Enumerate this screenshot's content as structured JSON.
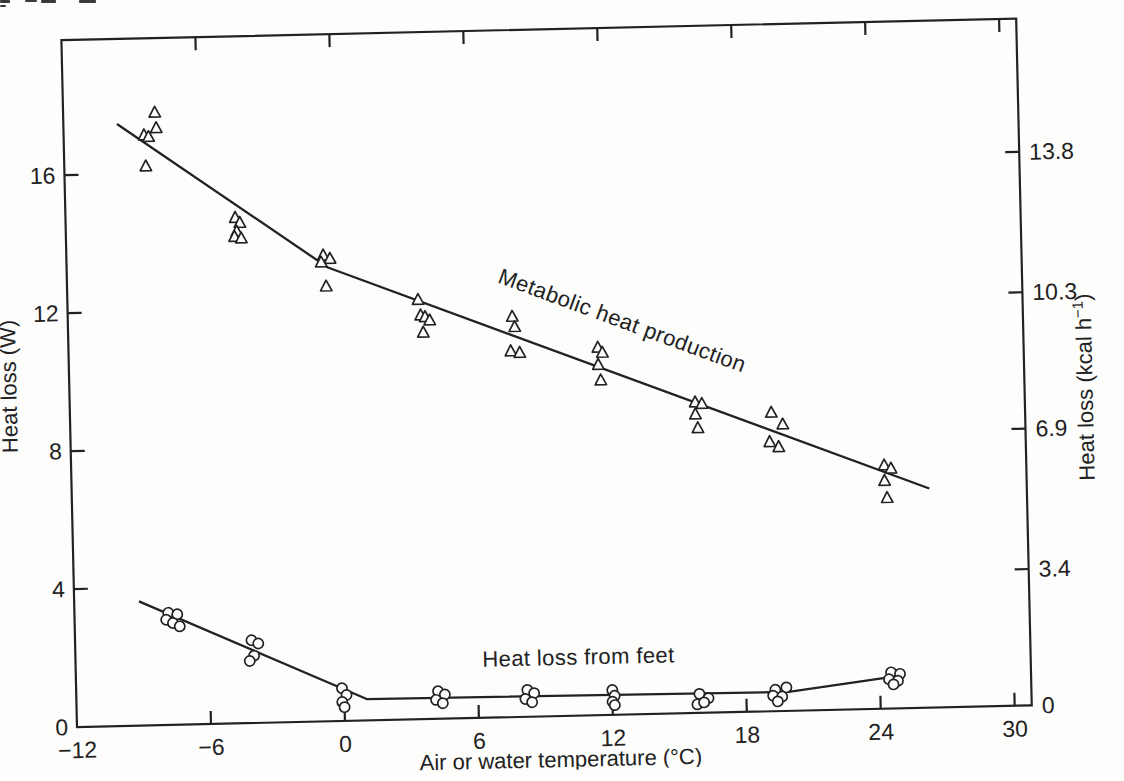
{
  "figure": {
    "paper_color": "#fdfdfc",
    "ink_color": "#222222",
    "scan_tilt_deg": -1.3
  },
  "scan_artifacts": [
    {
      "x": 0,
      "y": 0,
      "w": 10,
      "h": 3
    },
    {
      "x": 0,
      "y": 5,
      "w": 6,
      "h": 2
    },
    {
      "x": 25,
      "y": 0,
      "w": 12,
      "h": 2
    },
    {
      "x": 41,
      "y": 0,
      "w": 15,
      "h": 3
    },
    {
      "x": 79,
      "y": 0,
      "w": 17,
      "h": 3
    }
  ],
  "chart_data": {
    "type": "scatter",
    "title": "",
    "xlabel": "Air or water temperature (°C)",
    "ylabel_left": "Heat loss (W)",
    "ylabel_right": "Heat loss (kcal h⁻¹)",
    "xlim": [
      -12,
      30.7
    ],
    "ylim_watts": [
      0,
      19.9
    ],
    "x_ticks": [
      -12,
      -6,
      0,
      6,
      12,
      18,
      24,
      30
    ],
    "y_ticks_left": [
      0,
      4,
      8,
      12,
      16
    ],
    "y_ticks_right": [
      "0",
      "3.4",
      "6.9",
      "10.3",
      "13.8"
    ],
    "kcal_per_watt": 0.86,
    "grid": false,
    "legend": "inline-annotations",
    "series": [
      {
        "name": "Metabolic heat production",
        "marker": "triangle",
        "points": [
          [
            -7.9,
            17.75
          ],
          [
            -7.85,
            17.3
          ],
          [
            -8.4,
            17.1
          ],
          [
            -8.2,
            17.05
          ],
          [
            -8.35,
            16.2
          ],
          [
            -4.4,
            14.65
          ],
          [
            -4.2,
            14.5
          ],
          [
            -4.35,
            14.25
          ],
          [
            -4.45,
            14.1
          ],
          [
            -4.15,
            14.05
          ],
          [
            -0.5,
            13.5
          ],
          [
            -0.2,
            13.4
          ],
          [
            -0.6,
            13.3
          ],
          [
            -0.4,
            12.6
          ],
          [
            3.7,
            12.15
          ],
          [
            3.8,
            11.7
          ],
          [
            4.0,
            11.65
          ],
          [
            4.2,
            11.55
          ],
          [
            3.9,
            11.2
          ],
          [
            7.9,
            11.6
          ],
          [
            8.0,
            11.3
          ],
          [
            7.8,
            10.6
          ],
          [
            8.2,
            10.55
          ],
          [
            11.7,
            10.65
          ],
          [
            11.9,
            10.5
          ],
          [
            11.7,
            10.15
          ],
          [
            11.8,
            9.7
          ],
          [
            16.0,
            9.0
          ],
          [
            16.3,
            8.95
          ],
          [
            16.0,
            8.65
          ],
          [
            16.1,
            8.25
          ],
          [
            19.4,
            8.65
          ],
          [
            19.9,
            8.3
          ],
          [
            19.3,
            7.8
          ],
          [
            19.7,
            7.65
          ],
          [
            24.4,
            7.05
          ],
          [
            24.7,
            6.95
          ],
          [
            24.4,
            6.6
          ],
          [
            24.5,
            6.1
          ]
        ],
        "fit_line": [
          [
            -9.6,
            17.45
          ],
          [
            -0.3,
            13.15
          ],
          [
            26.4,
            6.35
          ]
        ]
      },
      {
        "name": "Heat loss from feet",
        "marker": "circle",
        "points": [
          [
            -7.8,
            3.25
          ],
          [
            -7.4,
            3.2
          ],
          [
            -7.9,
            3.05
          ],
          [
            -7.6,
            2.95
          ],
          [
            -7.3,
            2.85
          ],
          [
            -4.1,
            2.4
          ],
          [
            -3.8,
            2.3
          ],
          [
            -4.0,
            1.95
          ],
          [
            -4.2,
            1.8
          ],
          [
            -0.1,
            0.95
          ],
          [
            0.1,
            0.75
          ],
          [
            -0.1,
            0.55
          ],
          [
            0.0,
            0.4
          ],
          [
            4.2,
            0.8
          ],
          [
            4.5,
            0.7
          ],
          [
            4.1,
            0.55
          ],
          [
            4.4,
            0.45
          ],
          [
            8.2,
            0.78
          ],
          [
            8.5,
            0.68
          ],
          [
            8.1,
            0.52
          ],
          [
            8.4,
            0.42
          ],
          [
            12.0,
            0.72
          ],
          [
            12.1,
            0.55
          ],
          [
            12.0,
            0.38
          ],
          [
            12.1,
            0.28
          ],
          [
            15.9,
            0.55
          ],
          [
            16.3,
            0.42
          ],
          [
            15.8,
            0.25
          ],
          [
            16.1,
            0.3
          ],
          [
            19.3,
            0.62
          ],
          [
            19.8,
            0.68
          ],
          [
            19.2,
            0.45
          ],
          [
            19.6,
            0.42
          ],
          [
            19.4,
            0.28
          ],
          [
            24.5,
            1.05
          ],
          [
            24.9,
            1.0
          ],
          [
            24.4,
            0.85
          ],
          [
            24.8,
            0.8
          ],
          [
            24.6,
            0.7
          ]
        ],
        "fit_line": [
          [
            -9.1,
            3.6
          ],
          [
            1.0,
            0.62
          ],
          [
            19.9,
            0.55
          ],
          [
            25.0,
            0.95
          ]
        ]
      }
    ],
    "annotations": [
      {
        "text": "Metabolic heat production",
        "x": 12.7,
        "w": 11.22,
        "rotation_deg": 21.5
      },
      {
        "text": "Heat loss from feet",
        "x": 10.52,
        "w": 1.48,
        "rotation_deg": 0
      }
    ]
  }
}
